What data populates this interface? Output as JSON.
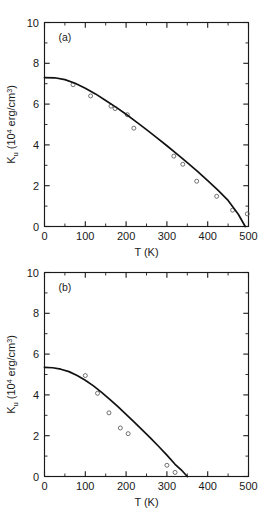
{
  "figure": {
    "background": "#ffffff",
    "curve_color": "#111111",
    "marker_color": "#5a5a5a",
    "axis_color": "#1a1a1a"
  },
  "axis_titles": {
    "x": "T (K)",
    "y_symbol": "K",
    "y_subscript": "u",
    "y_units_open": " (10",
    "y_units_exponent": "4",
    "y_units_rest": " erg/cm",
    "y_units_exponent2": "3",
    "y_units_close": ")"
  },
  "x_ticks": [
    "0",
    "100",
    "200",
    "300",
    "400",
    "500"
  ],
  "y_ticks": [
    "0",
    "2",
    "4",
    "6",
    "8",
    "10"
  ],
  "chart_data": [
    {
      "type": "scatter",
      "title": "",
      "panel_label": "(a)",
      "xlabel": "T (K)",
      "ylabel": "K_u (10^4 erg/cm^3)",
      "xlim": [
        0,
        500
      ],
      "ylim": [
        0,
        10
      ],
      "xticks": [
        0,
        100,
        200,
        300,
        400,
        500
      ],
      "yticks": [
        0,
        2,
        4,
        6,
        8,
        10
      ],
      "xminor_step": 50,
      "yminor_step": 1,
      "grid": false,
      "legend": "none",
      "series": [
        {
          "name": "measured Ku",
          "style": "open-circle",
          "x": [
            70,
            113,
            163,
            173,
            203,
            219,
            317,
            339,
            373,
            422,
            461,
            497
          ],
          "y": [
            6.95,
            6.4,
            5.9,
            5.78,
            5.48,
            4.82,
            3.45,
            3.05,
            2.22,
            1.48,
            0.8,
            0.62
          ]
        },
        {
          "name": "model curve",
          "style": "solid-line",
          "x": [
            0,
            25,
            50,
            75,
            100,
            125,
            150,
            175,
            200,
            225,
            250,
            275,
            300,
            325,
            350,
            375,
            400,
            425,
            450,
            475,
            492
          ],
          "y": [
            7.3,
            7.29,
            7.2,
            7.02,
            6.78,
            6.5,
            6.18,
            5.85,
            5.5,
            5.13,
            4.75,
            4.36,
            3.96,
            3.55,
            3.13,
            2.7,
            2.25,
            1.78,
            1.28,
            0.6,
            0.0
          ]
        }
      ]
    },
    {
      "type": "scatter",
      "title": "",
      "panel_label": "(b)",
      "xlabel": "T (K)",
      "ylabel": "K_u (10^4 erg/cm^3)",
      "xlim": [
        0,
        500
      ],
      "ylim": [
        0,
        10
      ],
      "xticks": [
        0,
        100,
        200,
        300,
        400,
        500
      ],
      "yticks": [
        0,
        2,
        4,
        6,
        8,
        10
      ],
      "xminor_step": 50,
      "yminor_step": 1,
      "grid": false,
      "legend": "none",
      "series": [
        {
          "name": "measured Ku",
          "style": "open-circle",
          "x": [
            100,
            130,
            158,
            186,
            205,
            300,
            320
          ],
          "y": [
            4.95,
            4.08,
            3.12,
            2.38,
            2.1,
            0.55,
            0.2
          ]
        },
        {
          "name": "model curve",
          "style": "solid-line",
          "x": [
            0,
            20,
            40,
            60,
            80,
            100,
            120,
            140,
            160,
            180,
            200,
            220,
            240,
            260,
            280,
            300,
            320,
            335,
            350
          ],
          "y": [
            5.35,
            5.33,
            5.26,
            5.14,
            4.95,
            4.72,
            4.44,
            4.12,
            3.78,
            3.42,
            3.04,
            2.66,
            2.27,
            1.88,
            1.47,
            1.05,
            0.6,
            0.33,
            0.0
          ]
        }
      ]
    }
  ]
}
